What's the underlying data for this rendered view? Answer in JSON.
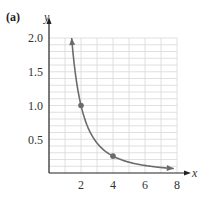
{
  "panel_label": "(a)",
  "colors": {
    "curve": "#6b6b6b",
    "grid": "#d8d8d8",
    "axis": "#222222",
    "point": "#6b6b6b"
  },
  "chart_data": {
    "type": "line",
    "title": "",
    "xlabel": "x",
    "ylabel": "y",
    "xlim": [
      0,
      8
    ],
    "ylim": [
      0,
      2.0
    ],
    "x_ticks": [
      "2",
      "4",
      "6",
      "8"
    ],
    "y_ticks": [
      "0.5",
      "1.0",
      "1.5",
      "2.0"
    ],
    "grid": true,
    "grid_x_step": 1,
    "grid_y_step": 0.1,
    "function": "y = 4/x^2",
    "series": [
      {
        "name": "curve",
        "x": [
          1.414,
          1.6,
          2,
          2.5,
          3,
          4,
          5,
          6,
          7,
          7.8
        ],
        "y": [
          2.0,
          1.5625,
          1.0,
          0.64,
          0.444,
          0.25,
          0.16,
          0.111,
          0.082,
          0.066
        ],
        "arrows_at_ends": true
      }
    ],
    "marked_points": [
      {
        "x": 2,
        "y": 1.0
      },
      {
        "x": 4,
        "y": 0.25
      }
    ]
  }
}
